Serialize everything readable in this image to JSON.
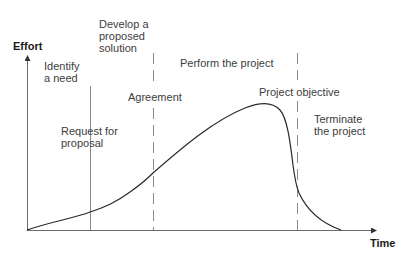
{
  "diagram": {
    "type": "project-life-cycle-effort-curve",
    "axes": {
      "y_label": "Effort",
      "x_label": "Time"
    },
    "phases": [
      {
        "label": "Identify\na need"
      },
      {
        "label": "Develop a\nproposed\nsolution"
      },
      {
        "label": "Perform the project"
      },
      {
        "label": "Terminate\nthe project"
      }
    ],
    "milestones": [
      {
        "label": "Request for\nproposal",
        "line_style": "solid"
      },
      {
        "label": "Agreement",
        "line_style": "dashed"
      },
      {
        "label": "Project objective",
        "line_style": "dashed"
      }
    ],
    "colors": {
      "curve": "#2a2a2a",
      "axis": "#6a6a6a",
      "divider": "#8a8a8a",
      "text": "#3d3d3d"
    }
  }
}
